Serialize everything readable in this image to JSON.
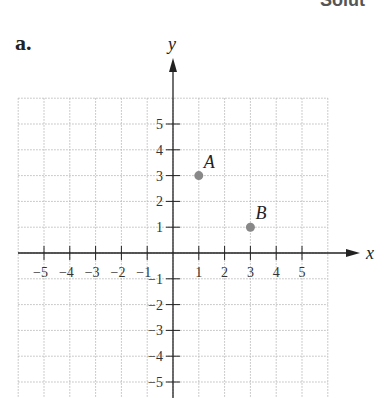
{
  "header": {
    "part_label": "a.",
    "cut_text": "Solut"
  },
  "chart_data": {
    "type": "scatter",
    "title": "",
    "xlabel": "x",
    "ylabel": "y",
    "xlim": [
      -6,
      6
    ],
    "ylim": [
      -6,
      6
    ],
    "grid": true,
    "x_ticks": [
      -5,
      -4,
      -3,
      -2,
      -1,
      1,
      2,
      3,
      4,
      5
    ],
    "y_ticks": [
      -5,
      -4,
      -3,
      -2,
      -1,
      1,
      2,
      3,
      4,
      5
    ],
    "points": [
      {
        "label": "A",
        "x": 1,
        "y": 3
      },
      {
        "label": "B",
        "x": 3,
        "y": 1
      }
    ],
    "colors": {
      "axis": "#222222",
      "grid": "#bbbbbb",
      "point": "#888888"
    }
  }
}
